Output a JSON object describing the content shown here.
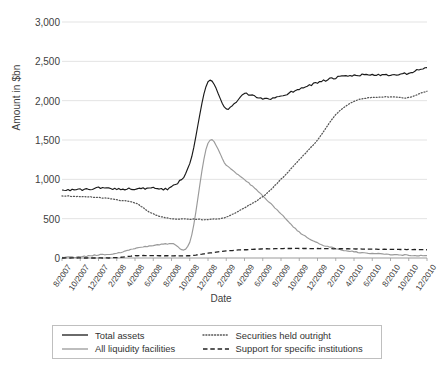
{
  "chart_data": {
    "type": "line",
    "title": "",
    "xlabel": "Date",
    "ylabel": "Amount in $bn",
    "ylim": [
      0,
      3000
    ],
    "ytick_labels": [
      "0",
      "500",
      "1,000",
      "1,500",
      "2,000",
      "2,500",
      "3,000"
    ],
    "ytick_values": [
      0,
      500,
      1000,
      1500,
      2000,
      2500,
      3000
    ],
    "grid": "horizontal",
    "legend_position": "bottom",
    "x": [
      "8/2007",
      "10/2007",
      "12/2007",
      "2/2008",
      "4/2008",
      "6/2008",
      "8/2008",
      "10/2008",
      "12/2008",
      "2/2009",
      "4/2009",
      "6/2009",
      "8/2009",
      "10/2009",
      "12/2009",
      "2/2010",
      "4/2010",
      "6/2010",
      "8/2010",
      "10/2010",
      "12/2010"
    ],
    "series": [
      {
        "name": "Total assets",
        "style": "solid",
        "color": "#1a1a1a",
        "values": [
          870,
          865,
          890,
          880,
          880,
          885,
          900,
          1200,
          2240,
          1900,
          2080,
          2020,
          2060,
          2150,
          2230,
          2290,
          2320,
          2330,
          2320,
          2350,
          2420
        ]
      },
      {
        "name": "All liquidity facilities",
        "style": "solid",
        "color": "#9a9a9a",
        "values": [
          10,
          15,
          40,
          60,
          120,
          160,
          185,
          200,
          1460,
          1180,
          1000,
          790,
          560,
          330,
          190,
          120,
          80,
          60,
          45,
          35,
          30
        ]
      },
      {
        "name": "Securities held outright",
        "style": "dotted",
        "color": "#555555",
        "values": [
          790,
          780,
          770,
          740,
          700,
          560,
          500,
          495,
          490,
          520,
          640,
          780,
          1000,
          1250,
          1500,
          1820,
          1990,
          2040,
          2050,
          2040,
          2120
        ]
      },
      {
        "name": "Support for specific institutions",
        "style": "dashed",
        "color": "#222222",
        "values": [
          0,
          0,
          0,
          5,
          28,
          30,
          28,
          30,
          60,
          90,
          105,
          115,
          120,
          122,
          120,
          118,
          115,
          112,
          110,
          108,
          105
        ]
      }
    ]
  },
  "axes": {
    "y_title": "Amount in $bn",
    "x_title": "Date"
  },
  "legend": {
    "entries": [
      {
        "label": "Total assets",
        "style": "solid",
        "color": "#1a1a1a"
      },
      {
        "label": "Securities held outright",
        "style": "dotted",
        "color": "#555555"
      },
      {
        "label": "All liquidity facilities",
        "style": "solid",
        "color": "#9a9a9a"
      },
      {
        "label": "Support for specific institutions",
        "style": "dashed",
        "color": "#222222"
      }
    ]
  },
  "colors": {
    "grid": "#e3e3e3",
    "axis": "#9a9a9a",
    "text": "#404040",
    "background": "#ffffff"
  }
}
